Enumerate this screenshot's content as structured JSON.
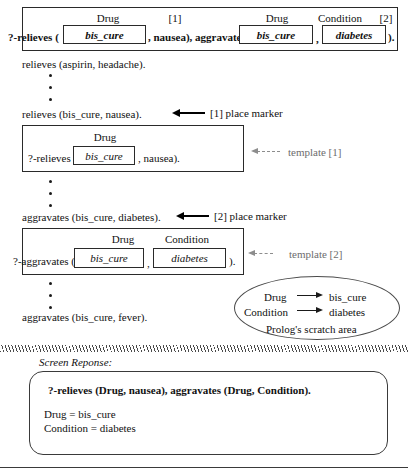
{
  "figure": {
    "title_query_box": {
      "headers": [
        {
          "label": "Drug",
          "tag": ""
        },
        {
          "label": "[1]",
          "tag": "marker"
        },
        {
          "label": "Drug",
          "tag": ""
        },
        {
          "label": "Condition",
          "tag": ""
        },
        {
          "label": "[2]",
          "tag": "marker"
        }
      ],
      "prefix": "?-relieves (",
      "slot1_value": "bis_cure",
      "mid_text": ", nausea), aggravates (",
      "slot2_value": "bis_cure",
      "comma": ",",
      "slot3_value": "diabetes",
      "suffix": ")."
    },
    "fact_lines": [
      "relieves (aspirin, headache).",
      "relieves (bis_cure, nausea).",
      "aggravates (bis_cure, diabetes).",
      "aggravates (bis_cure, fever)."
    ],
    "annotations": {
      "marker1": "[1] place marker",
      "marker2": "[2] place marker",
      "template1": "template [1]",
      "template2": "template [2]"
    },
    "template1_box": {
      "header": "Drug",
      "prefix": "?-relieves (",
      "slot_value": "bis_cure",
      "suffix": ", nausea)."
    },
    "template2_box": {
      "header1": "Drug",
      "header2": "Condition",
      "prefix": "?-aggravates (",
      "slot1_value": "bis_cure",
      "comma": ",",
      "slot2_value": "diabetes",
      "suffix": ")."
    },
    "scratch_area": {
      "caption": "Prolog's scratch area",
      "bindings": [
        {
          "variable": "Drug",
          "value": "bis_cure"
        },
        {
          "variable": "Condition",
          "value": "diabetes"
        }
      ]
    },
    "screen_response": {
      "caption": "Screen Reponse:",
      "query": "?-relieves (Drug, nausea), aggravates (Drug, Condition).",
      "results": [
        "Drug = bis_cure",
        "Condition = diabetes"
      ]
    }
  }
}
